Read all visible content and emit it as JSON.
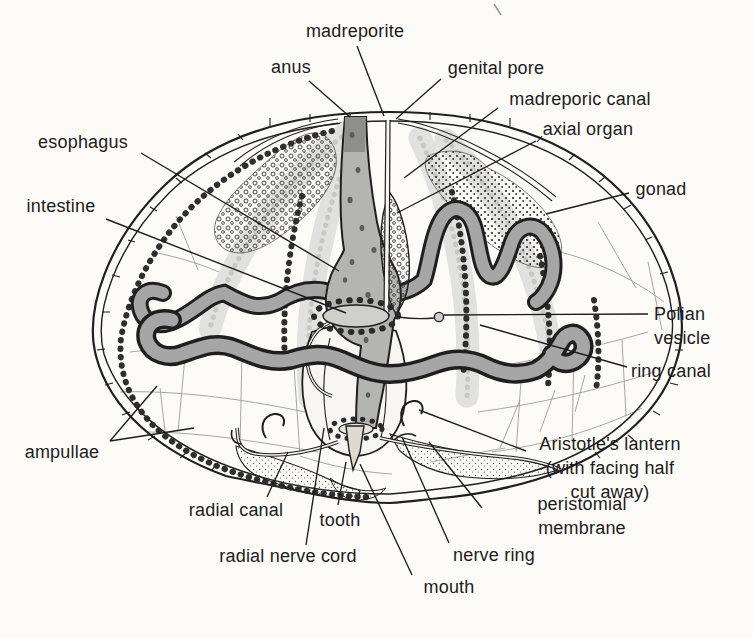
{
  "figure": {
    "background_color": "#fcfbf8",
    "ink_color": "#1c1c1c"
  },
  "labels": {
    "madreporite": "madreporite",
    "anus": "anus",
    "genital_pore": "genital pore",
    "madreporic_canal": "madreporic canal",
    "axial_organ": "axial organ",
    "gonad": "gonad",
    "esophagus": "esophagus",
    "intestine": "intestine",
    "polian_vesicle": "Polian vesicle",
    "ring_canal": "ring canal",
    "ampullae": "ampullae",
    "aristotles_lantern": "Aristotle's lantern\n(with facing half cut away)",
    "peristomial_membrane": "peristomial membrane",
    "radial_canal": "radial canal",
    "tooth": "tooth",
    "radial_nerve_cord": "radial nerve cord",
    "nerve_ring": "nerve ring",
    "mouth": "mouth"
  }
}
